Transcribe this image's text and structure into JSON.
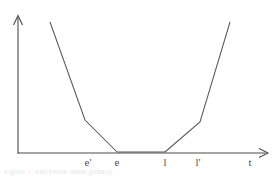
{
  "figure": {
    "background_color": "#ffffff",
    "line_color": "#595959",
    "axis_color": "#4a4a4a",
    "caption_fragment": "Figure 1: Piecewise linear penalty"
  },
  "axes": {
    "x_label": "t",
    "y_label": "",
    "origin": {
      "x": 18,
      "y": 153
    },
    "x_axis_end": {
      "x": 268,
      "y": 153
    },
    "y_axis_top": {
      "x": 18,
      "y": 16
    }
  },
  "ticks": {
    "x": [
      {
        "label": "e'",
        "x": 88
      },
      {
        "label": "e",
        "x": 117
      },
      {
        "label": "l",
        "x": 165
      },
      {
        "label": "l'",
        "x": 198
      }
    ]
  },
  "chart_data": {
    "type": "line",
    "title": "",
    "subtitle": "",
    "xlabel": "t",
    "ylabel": "",
    "grid": false,
    "legend_position": "none",
    "xlim": [
      18,
      268
    ],
    "ylim": [
      153,
      16
    ],
    "annotations": [
      "e'",
      "e",
      "l",
      "l'",
      "t"
    ],
    "series": [
      {
        "name": "earliness-penalty",
        "points": [
          {
            "x": 50,
            "y": 22
          },
          {
            "x": 85,
            "y": 120
          },
          {
            "x": 117,
            "y": 152
          }
        ]
      },
      {
        "name": "zero-penalty-window",
        "points": [
          {
            "x": 117,
            "y": 152
          },
          {
            "x": 165,
            "y": 152
          }
        ]
      },
      {
        "name": "tardiness-penalty",
        "points": [
          {
            "x": 165,
            "y": 152
          },
          {
            "x": 200,
            "y": 122
          },
          {
            "x": 230,
            "y": 22
          }
        ]
      }
    ]
  }
}
